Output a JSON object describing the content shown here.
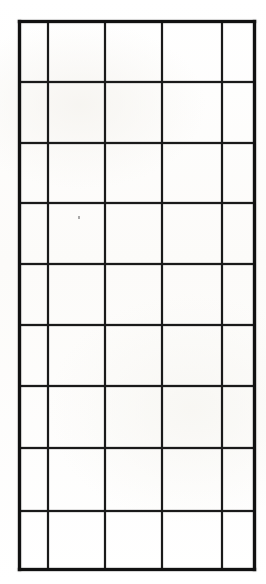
{
  "document": {
    "kind": "scanned-blank-grid-form",
    "title": "Blank Grid Form",
    "description": "Hand-drawn blank table grid on scanned paper",
    "page_background": "#fdfdfc",
    "ink_color": "#1a1a1a",
    "border_color": "#111111"
  },
  "grid": {
    "columns": 5,
    "rows": 9,
    "total_cells": 45,
    "bounds": {
      "left": 19,
      "top": 21,
      "right": 255,
      "bottom": 570,
      "width": 236,
      "height": 549
    },
    "column_x": [
      19,
      48,
      105,
      162,
      222,
      255
    ],
    "column_widths": [
      29,
      57,
      57,
      60,
      33
    ],
    "row_y": [
      21,
      82,
      143,
      203,
      264,
      325,
      386,
      448,
      511,
      570
    ],
    "row_heights": [
      61,
      61,
      60,
      61,
      61,
      61,
      62,
      63,
      59
    ],
    "cells": [
      [
        "",
        "",
        "",
        "",
        ""
      ],
      [
        "",
        "",
        "",
        "",
        ""
      ],
      [
        "",
        "",
        "",
        "",
        ""
      ],
      [
        "",
        "",
        "",
        "",
        ""
      ],
      [
        "",
        "",
        "",
        "",
        ""
      ],
      [
        "",
        "",
        "",
        "",
        ""
      ],
      [
        "",
        "",
        "",
        "",
        ""
      ],
      [
        "",
        "",
        "",
        "",
        ""
      ],
      [
        "",
        "",
        "",
        "",
        ""
      ]
    ],
    "headers": [
      "",
      "",
      "",
      "",
      ""
    ]
  },
  "artifacts": {
    "speck": {
      "x": 78,
      "y": 216,
      "color": "#8d8d8d"
    }
  }
}
